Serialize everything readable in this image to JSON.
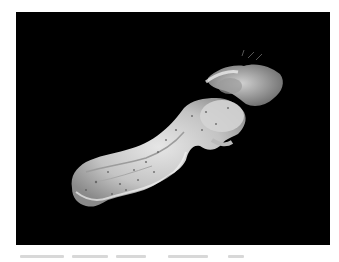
{
  "image": {
    "subject": "grayscale photograph of elongated tissue specimen on black background",
    "background_color": "#000000",
    "page_color": "#ffffff"
  },
  "caption": {
    "text": "",
    "legible": false
  }
}
